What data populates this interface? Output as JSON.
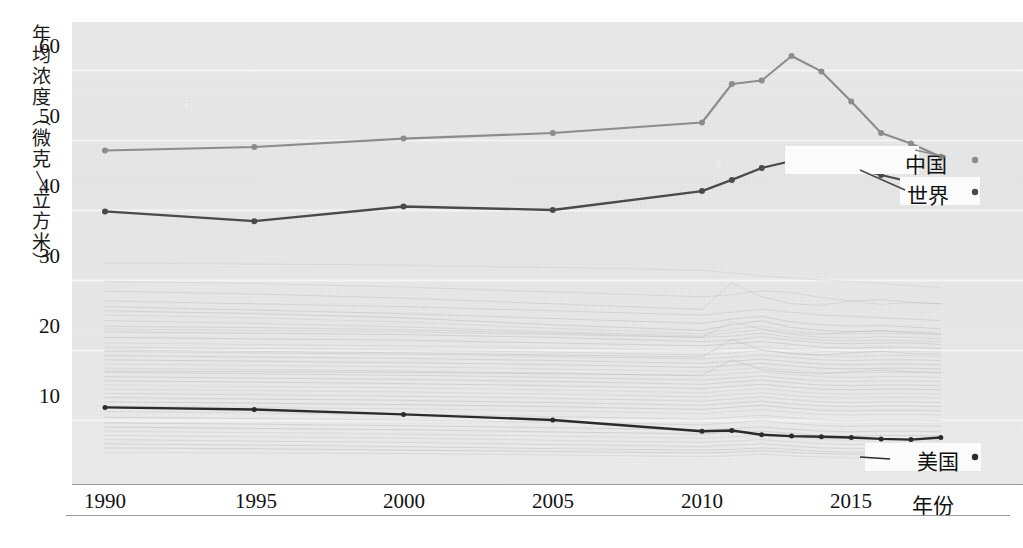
{
  "chart_data": {
    "type": "line",
    "title": "",
    "xlabel": "年份",
    "ylabel": "年均浓度(微克/立方米)",
    "ylabel_chars": [
      "年",
      "均",
      "浓",
      "度",
      "(",
      "微",
      "克",
      "/",
      "立",
      "方",
      "米",
      ")"
    ],
    "xlim": [
      1990,
      2018
    ],
    "ylim": [
      4,
      64
    ],
    "x_ticks": [
      1990,
      1995,
      2000,
      2005,
      2010,
      2015
    ],
    "y_ticks": [
      10,
      20,
      30,
      40,
      50,
      60
    ],
    "grid": true,
    "grid_orientation": "horizontal",
    "legend_position": "inline-right",
    "series": [
      {
        "name": "中国",
        "color": "#8c8c8c",
        "x": [
          1990,
          1995,
          2000,
          2005,
          2010,
          2011,
          2012,
          2013,
          2014,
          2015,
          2016,
          2017,
          2018
        ],
        "values": [
          48.5,
          49.0,
          50.2,
          51.0,
          52.5,
          58.0,
          58.5,
          62.0,
          59.8,
          55.5,
          51.0,
          49.5,
          47.6
        ]
      },
      {
        "name": "世界",
        "color": "#4a4a4a",
        "x": [
          1990,
          1995,
          2000,
          2005,
          2010,
          2011,
          2012,
          2013,
          2014,
          2015,
          2016,
          2017,
          2018
        ],
        "values": [
          39.8,
          38.4,
          40.5,
          40.0,
          42.7,
          44.3,
          46.0,
          47.0,
          46.6,
          46.0,
          45.0,
          44.0,
          42.0
        ]
      },
      {
        "name": "美国",
        "color": "#2b2b2b",
        "x": [
          1990,
          1995,
          2000,
          2005,
          2010,
          2011,
          2012,
          2013,
          2014,
          2015,
          2016,
          2017,
          2018
        ],
        "values": [
          11.8,
          11.5,
          10.8,
          10.0,
          8.4,
          8.5,
          7.9,
          7.7,
          7.6,
          7.5,
          7.3,
          7.2,
          7.5
        ]
      }
    ],
    "background_series_note": "约40条浅灰色国家折线",
    "background_series": [
      {
        "values": [
          32.4,
          32.3,
          32.1,
          31.8,
          31.4,
          31.0,
          30.6,
          30.3,
          30.0,
          29.8,
          29.5,
          29.2,
          28.9
        ]
      },
      {
        "values": [
          29.8,
          29.5,
          29.0,
          28.3,
          27.6,
          27.9,
          28.5,
          28.2,
          27.5,
          27.0,
          26.5,
          26.8,
          26.6
        ]
      },
      {
        "values": [
          27.0,
          26.6,
          26.2,
          25.6,
          25.0,
          25.4,
          25.8,
          25.4,
          25.0,
          24.8,
          24.6,
          24.4,
          24.2
        ]
      },
      {
        "values": [
          26.2,
          25.7,
          25.2,
          24.5,
          23.8,
          24.4,
          24.8,
          24.0,
          23.6,
          23.4,
          23.5,
          23.3,
          23.0
        ]
      },
      {
        "values": [
          25.6,
          25.2,
          24.6,
          23.6,
          22.8,
          23.6,
          24.2,
          23.2,
          22.8,
          22.6,
          22.7,
          22.6,
          22.4
        ]
      },
      {
        "values": [
          25.0,
          24.6,
          24.0,
          23.1,
          22.3,
          23.0,
          23.4,
          22.7,
          22.4,
          22.3,
          22.4,
          22.3,
          22.2
        ]
      },
      {
        "values": [
          24.2,
          23.8,
          23.3,
          22.6,
          22.0,
          22.5,
          22.9,
          22.2,
          21.8,
          21.7,
          21.9,
          21.8,
          21.6
        ]
      },
      {
        "values": [
          23.4,
          23.2,
          22.9,
          22.4,
          21.8,
          22.0,
          22.4,
          21.8,
          21.4,
          21.3,
          21.4,
          21.3,
          21.2
        ]
      },
      {
        "values": [
          22.6,
          22.4,
          22.2,
          21.8,
          21.2,
          21.4,
          21.9,
          21.4,
          21.0,
          20.9,
          21.0,
          21.0,
          20.8
        ]
      },
      {
        "values": [
          21.8,
          21.6,
          21.4,
          21.0,
          20.6,
          20.9,
          21.2,
          20.8,
          20.4,
          20.3,
          20.4,
          20.4,
          20.2
        ]
      },
      {
        "values": [
          21.0,
          20.8,
          20.6,
          20.3,
          19.9,
          20.2,
          20.5,
          20.1,
          19.8,
          19.7,
          19.8,
          19.8,
          19.7
        ]
      },
      {
        "values": [
          20.4,
          20.2,
          20.0,
          19.7,
          19.3,
          19.6,
          19.9,
          19.5,
          19.2,
          19.1,
          19.2,
          19.2,
          19.1
        ]
      },
      {
        "values": [
          19.8,
          19.6,
          19.4,
          19.1,
          18.7,
          19.0,
          19.3,
          18.9,
          18.6,
          18.5,
          18.6,
          18.6,
          18.5
        ]
      },
      {
        "values": [
          19.2,
          19.0,
          18.8,
          18.5,
          18.1,
          18.4,
          18.7,
          18.3,
          18.0,
          17.9,
          18.0,
          18.0,
          17.9
        ]
      },
      {
        "values": [
          18.6,
          18.4,
          18.2,
          17.9,
          17.5,
          17.8,
          18.1,
          17.7,
          17.4,
          17.3,
          17.4,
          17.4,
          17.3
        ]
      },
      {
        "values": [
          18.0,
          17.8,
          17.6,
          17.3,
          16.9,
          17.2,
          17.5,
          17.1,
          16.8,
          16.7,
          16.8,
          16.8,
          16.7
        ]
      },
      {
        "values": [
          17.4,
          17.2,
          17.0,
          16.7,
          16.3,
          16.6,
          16.9,
          16.5,
          16.2,
          16.1,
          16.2,
          16.2,
          16.1
        ]
      },
      {
        "values": [
          16.8,
          16.6,
          16.4,
          16.1,
          15.7,
          16.0,
          16.3,
          15.9,
          15.6,
          15.5,
          15.6,
          15.6,
          15.5
        ]
      },
      {
        "values": [
          16.2,
          16.0,
          15.8,
          15.5,
          15.1,
          15.4,
          15.7,
          15.3,
          15.0,
          14.9,
          15.0,
          15.0,
          14.9
        ]
      },
      {
        "values": [
          15.6,
          15.4,
          15.2,
          14.9,
          14.5,
          14.8,
          15.1,
          14.7,
          14.4,
          14.3,
          14.4,
          14.4,
          14.3
        ]
      },
      {
        "values": [
          15.0,
          14.8,
          14.6,
          14.3,
          13.9,
          14.2,
          14.5,
          14.1,
          13.8,
          13.7,
          13.8,
          13.8,
          13.7
        ]
      },
      {
        "values": [
          14.4,
          14.2,
          14.0,
          13.7,
          13.3,
          13.6,
          13.9,
          13.5,
          13.2,
          13.1,
          13.2,
          13.2,
          13.1
        ]
      },
      {
        "values": [
          13.8,
          13.6,
          13.4,
          13.1,
          12.7,
          13.0,
          13.3,
          12.9,
          12.6,
          12.5,
          12.6,
          12.6,
          12.5
        ]
      },
      {
        "values": [
          13.2,
          13.0,
          12.8,
          12.5,
          12.1,
          12.4,
          12.7,
          12.3,
          12.0,
          11.9,
          12.0,
          12.0,
          11.9
        ]
      },
      {
        "values": [
          12.6,
          12.4,
          12.2,
          11.9,
          11.5,
          11.8,
          12.1,
          11.7,
          11.4,
          11.3,
          11.4,
          11.4,
          11.3
        ]
      },
      {
        "values": [
          12.0,
          11.8,
          11.6,
          11.3,
          10.9,
          11.2,
          11.5,
          11.1,
          10.8,
          10.7,
          10.8,
          10.8,
          10.7
        ]
      },
      {
        "values": [
          11.2,
          11.0,
          10.8,
          10.5,
          10.1,
          10.4,
          10.7,
          10.3,
          10.0,
          9.9,
          10.0,
          10.0,
          9.9
        ]
      },
      {
        "values": [
          10.4,
          10.2,
          10.0,
          9.7,
          9.3,
          9.6,
          9.9,
          9.5,
          9.2,
          9.1,
          9.2,
          9.2,
          9.1
        ]
      },
      {
        "values": [
          9.6,
          9.4,
          9.2,
          8.9,
          8.6,
          8.8,
          9.0,
          8.7,
          8.4,
          8.3,
          8.4,
          8.4,
          8.3
        ]
      },
      {
        "values": [
          9.0,
          8.8,
          8.6,
          8.3,
          8.0,
          8.2,
          8.4,
          8.1,
          7.8,
          7.7,
          7.8,
          7.8,
          7.7
        ]
      },
      {
        "values": [
          8.4,
          8.2,
          8.0,
          7.7,
          7.4,
          7.6,
          7.8,
          7.5,
          7.2,
          7.1,
          7.2,
          7.2,
          7.1
        ]
      },
      {
        "values": [
          7.8,
          7.6,
          7.4,
          7.1,
          6.8,
          7.0,
          7.2,
          6.9,
          6.6,
          6.5,
          6.6,
          6.6,
          6.5
        ]
      },
      {
        "values": [
          7.2,
          7.0,
          6.8,
          6.5,
          6.2,
          6.4,
          6.6,
          6.3,
          6.0,
          5.9,
          6.0,
          6.0,
          5.9
        ]
      },
      {
        "values": [
          6.6,
          6.4,
          6.2,
          5.9,
          5.7,
          5.8,
          6.0,
          5.8,
          5.5,
          5.4,
          5.5,
          5.5,
          5.4
        ]
      },
      {
        "values": [
          6.0,
          5.9,
          5.7,
          5.5,
          5.3,
          5.4,
          5.6,
          5.4,
          5.2,
          5.1,
          5.2,
          5.2,
          5.1
        ]
      },
      {
        "values": [
          5.4,
          5.3,
          5.2,
          5.0,
          4.8,
          4.9,
          5.1,
          4.9,
          4.7,
          4.6,
          4.7,
          4.7,
          4.6
        ]
      },
      {
        "values": [
          23.0,
          22.8,
          22.6,
          22.2,
          21.8,
          24.0,
          23.0,
          22.4,
          22.2,
          22.6,
          22.8,
          22.4,
          22.2
        ]
      },
      {
        "values": [
          28.4,
          28.0,
          27.4,
          26.6,
          25.8,
          29.6,
          27.6,
          26.6,
          26.4,
          27.0,
          27.2,
          26.8,
          26.6
        ]
      },
      {
        "values": [
          20.0,
          19.8,
          19.6,
          19.3,
          19.0,
          21.5,
          20.0,
          19.5,
          19.3,
          19.6,
          19.8,
          19.5,
          19.4
        ]
      },
      {
        "values": [
          17.0,
          16.9,
          16.8,
          16.6,
          16.4,
          18.6,
          17.2,
          16.8,
          16.6,
          16.9,
          17.1,
          16.9,
          16.8
        ]
      }
    ]
  },
  "legend": {
    "china": "中国",
    "world": "世界",
    "usa": "美国"
  },
  "axes": {
    "y_ticks": [
      "60",
      "50",
      "40",
      "30",
      "20",
      "10"
    ],
    "x_ticks": [
      "1990",
      "1995",
      "2000",
      "2005",
      "2010",
      "2015"
    ],
    "x_title": "年份",
    "y_title_chars": [
      "年",
      "均",
      "浓",
      "度",
      "（",
      "微",
      "克",
      "/",
      "立",
      "方",
      "米",
      "）"
    ]
  },
  "colors": {
    "china_line": "#8c8c8c",
    "world_line": "#4a4a4a",
    "usa_line": "#2b2b2b",
    "background_lines": "#b9b9b9",
    "plot_background": "#e8e8e8",
    "gridline": "#f4f4f4",
    "axis": "#8a8a8a",
    "text": "#111111"
  }
}
